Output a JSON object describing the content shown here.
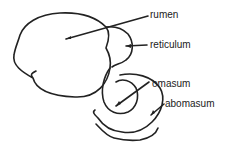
{
  "diagram": {
    "labels": [
      {
        "id": "rumen",
        "text": "rumen"
      },
      {
        "id": "reticulum",
        "text": "reticulum"
      },
      {
        "id": "omasum",
        "text": "omasum"
      },
      {
        "id": "abomasum",
        "text": "abomasum"
      }
    ],
    "colors": {
      "stroke": "#222222",
      "background": "#ffffff"
    }
  }
}
